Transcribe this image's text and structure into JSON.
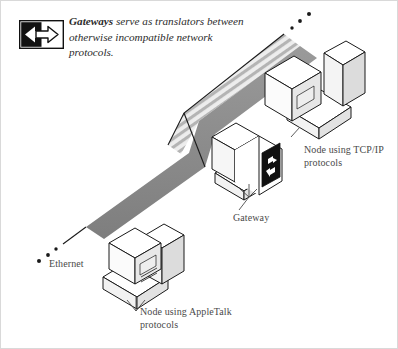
{
  "figure": {
    "caption": {
      "term": "Gateways",
      "rest": " serve as translators between otherwise incompatible network protocols."
    },
    "icon": {
      "name": "bidirectional-arrow-icon",
      "description": "black box with left white arrow and right outlined arrow"
    },
    "labels": {
      "tcpip_node": "Node using TCP/IP\nprotocols",
      "gateway": "Gateway",
      "ethernet": "Ethernet",
      "appletalk_node": "Node using AppleTalk\nprotocols"
    },
    "colors": {
      "cable_solid": "#8c8c8c",
      "cable_striped_light": "#d6d6d6",
      "cable_striped_dark": "#a0a0a0",
      "outline": "#1a1a1a",
      "device_face": "#ffffff",
      "device_shade": "#e8e8e8",
      "text": "#4a4a4a",
      "caption_text": "#2b2b2b",
      "border": "#d9d9d9"
    },
    "elements": {
      "tcpip_node": "isometric computer workstation",
      "appletalk_node": "isometric computer workstation",
      "gateway_device": "isometric box bearing bidirectional arrow icon",
      "solid_cable": "TCP/IP network segment",
      "striped_cable": "AppleTalk network segment",
      "dotted_line_top": "network continues off-figure",
      "dotted_line_left": "network continues off-figure"
    }
  }
}
